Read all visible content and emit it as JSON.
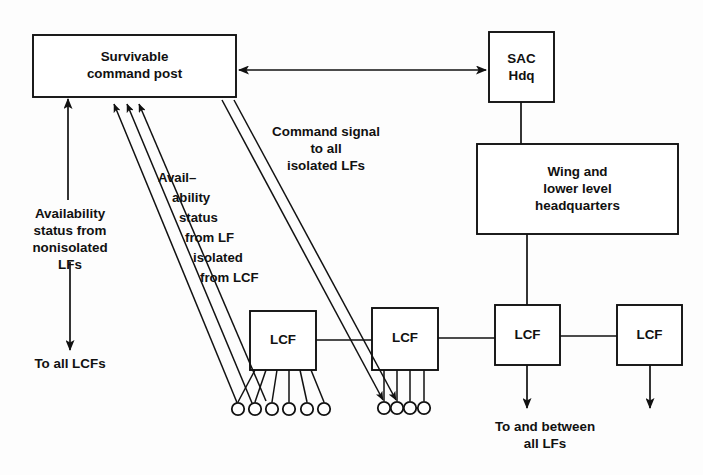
{
  "diagram": {
    "stroke_color": "#111111",
    "background_color": "#fdfdfd",
    "nodes": {
      "survivable_command_post": "Survivable\ncommand post",
      "sac_hdq": "SAC\nHdq",
      "wing_headquarters": "Wing and\nlower level\nheadquarters",
      "lcf_1": "LCF",
      "lcf_2": "LCF",
      "lcf_3": "LCF",
      "lcf_4": "LCF"
    },
    "labels": {
      "availability_nonisolated": "Availability\nstatus from\nnonisolated\nLFs",
      "to_all_lcfs": "To all LCFs",
      "availability_isolated_lines": [
        "Avail–",
        "ability",
        "status",
        "from LF",
        "isolated",
        "from LCF"
      ],
      "command_signal": "Command signal\nto all\nisolated LFs",
      "to_and_between": "To and between\nall LFs"
    },
    "lf_sites": {
      "under_lcf_1_count": 6,
      "under_lcf_2_count": 4
    }
  }
}
